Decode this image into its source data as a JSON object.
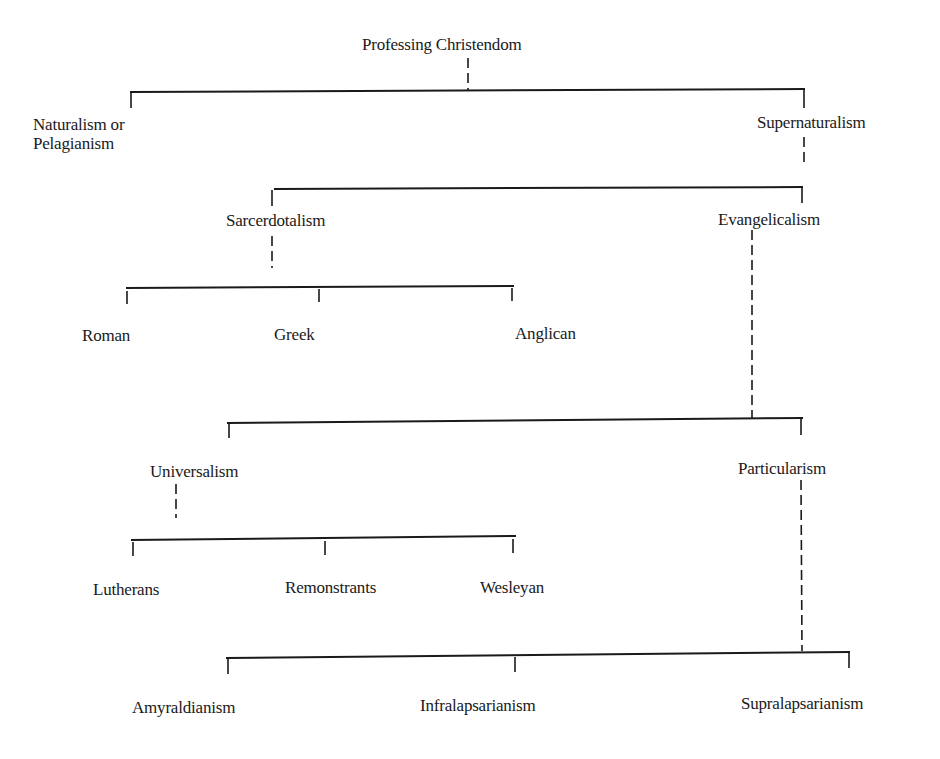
{
  "diagram": {
    "title": "Professing Christendom",
    "nodes": {
      "root": "Professing Christendom",
      "naturalism_line1": "Naturalism or",
      "naturalism_line2": "Pelagianism",
      "supernaturalism": "Supernaturalism",
      "sacerdotalism": "Sarcerdotalism",
      "evangelicalism": "Evangelicalism",
      "roman": "Roman",
      "greek": "Greek",
      "anglican": "Anglican",
      "universalism": "Universalism",
      "particularism": "Particularism",
      "lutherans": "Lutherans",
      "remonstrants": "Remonstrants",
      "wesleyan": "Wesleyan",
      "amyraldianism": "Amyraldianism",
      "infralapsarianism": "Infralapsarianism",
      "supralapsarianism": "Supralapsarianism"
    },
    "tree": {
      "label": "Professing Christendom",
      "children": [
        {
          "label": "Naturalism or Pelagianism"
        },
        {
          "label": "Supernaturalism",
          "children": [
            {
              "label": "Sarcerdotalism",
              "children": [
                {
                  "label": "Roman"
                },
                {
                  "label": "Greek"
                },
                {
                  "label": "Anglican"
                }
              ]
            },
            {
              "label": "Evangelicalism",
              "children": [
                {
                  "label": "Universalism",
                  "children": [
                    {
                      "label": "Lutherans"
                    },
                    {
                      "label": "Remonstrants"
                    },
                    {
                      "label": "Wesleyan"
                    }
                  ]
                },
                {
                  "label": "Particularism",
                  "children": [
                    {
                      "label": "Amyraldianism"
                    },
                    {
                      "label": "Infralapsarianism"
                    },
                    {
                      "label": "Supralapsarianism"
                    }
                  ]
                }
              ]
            }
          ]
        }
      ]
    },
    "colors": {
      "ink": "#1a1a1a",
      "background": "#ffffff"
    }
  }
}
